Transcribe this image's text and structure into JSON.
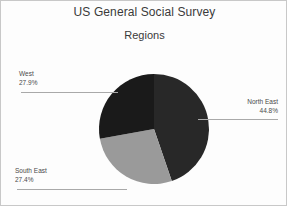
{
  "chart": {
    "title": "US General Social Survey",
    "subtitle": "Regions"
  },
  "labels": {
    "north_east": {
      "name": "North East",
      "percent": "44.8%"
    },
    "south_east": {
      "name": "South East",
      "percent": "27.4%"
    },
    "west": {
      "name": "West",
      "percent": "27.9%"
    }
  },
  "chart_data": {
    "type": "pie",
    "title": "US General Social Survey",
    "subtitle": "Regions",
    "xlabel": "",
    "ylabel": "",
    "legend": "none",
    "grid": false,
    "start_angle_deg": 0,
    "direction": "clockwise",
    "categories": [
      "North East",
      "South East",
      "West"
    ],
    "values": [
      44.8,
      27.4,
      27.9
    ],
    "value_labels": [
      "44.8%",
      "27.4%",
      "27.9%"
    ],
    "colors": [
      "#282828",
      "#9a9a9a",
      "#1a1a1a"
    ],
    "label_positions": [
      "right",
      "bottom-left",
      "top-left"
    ],
    "units": "percent",
    "total": 100.1
  },
  "style": {
    "background": "#fdfdfd",
    "border": "#c8c8c8",
    "text": "#4a4a4a",
    "title_color": "#3a3a3a",
    "leader_line": "#a9a9a9"
  }
}
